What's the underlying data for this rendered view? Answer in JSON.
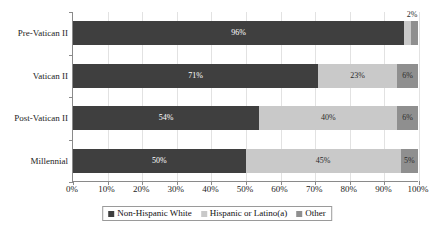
{
  "chart_data": {
    "type": "bar",
    "subtype": "horizontal-stacked-100",
    "title": "",
    "xlabel": "",
    "ylabel": "",
    "xlim": [
      0,
      100
    ],
    "grid": true,
    "legend_position": "bottom",
    "categories": [
      "Pre-Vatican II",
      "Vatican II",
      "Post-Vatican II",
      "Millennial"
    ],
    "xticks": [
      "0%",
      "10%",
      "20%",
      "30%",
      "40%",
      "50%",
      "60%",
      "70%",
      "80%",
      "90%",
      "100%"
    ],
    "xtick_values": [
      0,
      10,
      20,
      30,
      40,
      50,
      60,
      70,
      80,
      90,
      100
    ],
    "series": [
      {
        "name": "Non-Hispanic White",
        "color": "#3f3f3f",
        "values": [
          96,
          71,
          54,
          50
        ],
        "labels": [
          "96%",
          "71%",
          "54%",
          "50%"
        ],
        "label_visible": [
          true,
          true,
          true,
          true
        ],
        "label_position": "inside"
      },
      {
        "name": "Hispanic or Latino(a)",
        "color": "#c9c9c9",
        "values": [
          2,
          23,
          40,
          45
        ],
        "labels": [
          "2%",
          "23%",
          "40%",
          "45%"
        ],
        "label_visible": [
          false,
          true,
          true,
          true
        ],
        "label_position": "inside"
      },
      {
        "name": "Other",
        "color": "#8f8f8f",
        "values": [
          2,
          6,
          6,
          5
        ],
        "labels": [
          "2%",
          "6%",
          "6%",
          "5%"
        ],
        "label_visible": [
          false,
          true,
          true,
          true
        ],
        "label_position": "inside"
      }
    ],
    "outside_labels": [
      {
        "text": "2%",
        "x_value": 98,
        "row": 0
      }
    ]
  },
  "legend": {
    "entries": [
      {
        "label": "Non-Hispanic White",
        "color": "#3f3f3f"
      },
      {
        "label": "Hispanic or Latino(a)",
        "color": "#c9c9c9"
      },
      {
        "label": "Other",
        "color": "#8f8f8f"
      }
    ]
  }
}
